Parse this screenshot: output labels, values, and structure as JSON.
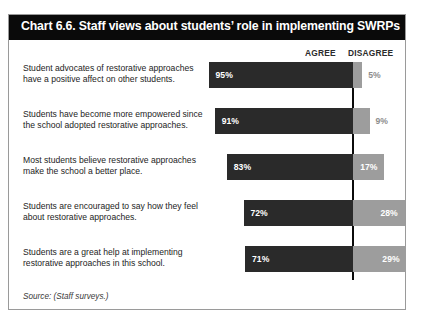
{
  "figure": {
    "title": "Chart 6.6. Staff views about students’ role in implementing SWRPs",
    "source": "Source: (Staff surveys.)",
    "headers": {
      "agree": "AGREE",
      "disagree": "DISAGREE"
    },
    "colors": {
      "title_bar": "#0a0a0a",
      "title_text": "#ffffff",
      "agree_bar": "#2a2a2a",
      "disagree_bar": "#9d9d9d",
      "baseline": "#0b0b0b",
      "frame": "#9a9a9a",
      "label_text": "#1d1d1d",
      "outside_value_text": "#8d8d8d"
    }
  },
  "chart_data": {
    "type": "bar",
    "title": "Chart 6.6. Staff views about students’ role in implementing SWRPs",
    "subtitle": "",
    "xlabel": "",
    "ylabel": "",
    "orientation": "horizontal",
    "stacked": true,
    "grid": false,
    "legend_position": "top-right",
    "xlim": [
      0,
      100
    ],
    "categories": [
      "Student advocates of restorative approaches have a positive affect on other students.",
      "Students have become more empowered since the school adopted restorative approaches.",
      "Most students believe restorative approaches make the school a better place.",
      "Students are encouraged to say how they feel about restorative approaches.",
      "Students are a great help at implementing restorative approaches in this school."
    ],
    "series": [
      {
        "name": "AGREE",
        "color": "#2a2a2a",
        "values": [
          95,
          91,
          83,
          72,
          71
        ]
      },
      {
        "name": "DISAGREE",
        "color": "#9d9d9d",
        "values": [
          5,
          9,
          17,
          28,
          29
        ]
      }
    ],
    "data_labels": {
      "agree": [
        "95%",
        "91%",
        "83%",
        "72%",
        "71%"
      ],
      "disagree": [
        "5%",
        "9%",
        "17%",
        "28%",
        "29%"
      ]
    },
    "annotations": [
      "Source: (Staff surveys.)"
    ]
  },
  "rows": [
    {
      "label": "Student advocates of restorative approaches have a positive affect on other students.",
      "agree_value": 95,
      "disagree_value": 29,
      "agree_label": "95%",
      "disagree_label": "5%",
      "disagree_label_inside": false
    },
    {
      "label": "Students have become more empowered since the school adopted restorative approaches.",
      "agree_value": 91,
      "disagree_value": 9,
      "agree_label": "91%",
      "disagree_label": "9%",
      "disagree_label_inside": false
    },
    {
      "label": "Most students believe restorative approaches make the school a better place.",
      "agree_value": 83,
      "disagree_value": 17,
      "agree_label": "83%",
      "disagree_label": "17%",
      "disagree_label_inside": true
    },
    {
      "label": "Students are encouraged to say how they feel about restorative approaches.",
      "agree_value": 72,
      "disagree_value": 28,
      "agree_label": "72%",
      "disagree_label": "28%",
      "disagree_label_inside": true
    },
    {
      "label": "Students are a great help at implementing restorative approaches in this school.",
      "agree_value": 71,
      "disagree_value": 29,
      "agree_label": "71%",
      "disagree_label": "29%",
      "disagree_label_inside": true
    }
  ]
}
